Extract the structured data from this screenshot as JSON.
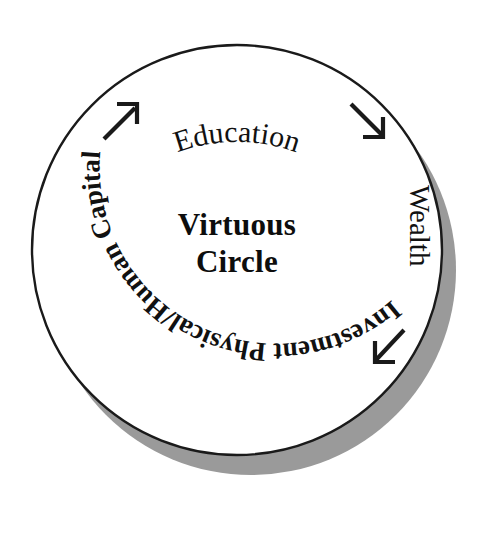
{
  "diagram": {
    "title": "Virtuous Circle",
    "center_label_line1": "Virtuous",
    "center_label_line2": "Circle",
    "shape": "circle",
    "flow_direction": "clockwise",
    "colors": {
      "background": "#ffffff",
      "circle_fill": "#ffffff",
      "circle_stroke": "#1a1a1a",
      "shadow": "#9a9a9a",
      "text": "#111111",
      "arrow": "#1a1a1a"
    },
    "geometry": {
      "center_x": 237,
      "center_y": 250,
      "radius": 205,
      "shadow_offset_x": 14,
      "shadow_offset_y": 20
    },
    "nodes": [
      {
        "id": "education",
        "label": "Education",
        "position": "top",
        "orientation": "arc-upright"
      },
      {
        "id": "wealth",
        "label": "Wealth",
        "position": "right",
        "orientation": "rotated-clockwise-90"
      },
      {
        "id": "investment",
        "label": "Investment Physical/Human Capital",
        "position": "bottom-left",
        "orientation": "arc-inverted"
      }
    ],
    "arrows": [
      {
        "id": "arrow-upper-left",
        "direction": "northeast",
        "glyph": "arrow-up-right",
        "from": "investment",
        "to": "education"
      },
      {
        "id": "arrow-upper-right",
        "direction": "southeast",
        "glyph": "arrow-down-right",
        "from": "education",
        "to": "wealth"
      },
      {
        "id": "arrow-lower-right",
        "direction": "southwest",
        "glyph": "arrow-down-left",
        "from": "wealth",
        "to": "investment"
      }
    ]
  }
}
